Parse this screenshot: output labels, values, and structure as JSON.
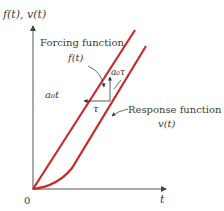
{
  "diagram": {
    "type": "ramp-response",
    "y_axis_label": "f(t), v(t)",
    "x_axis_label": "t",
    "origin_label": "0",
    "forcing": {
      "label": "Forcing function",
      "symbol": "f(t)",
      "slope_label": "a₀t"
    },
    "response": {
      "label": "Response function",
      "symbol": "v(t)"
    },
    "lag": {
      "time_label": "τ",
      "amplitude_label": "a₀τ"
    },
    "colors": {
      "curve": "#cc2a2a",
      "axis": "#555555",
      "text": "#3a3a3a"
    }
  }
}
